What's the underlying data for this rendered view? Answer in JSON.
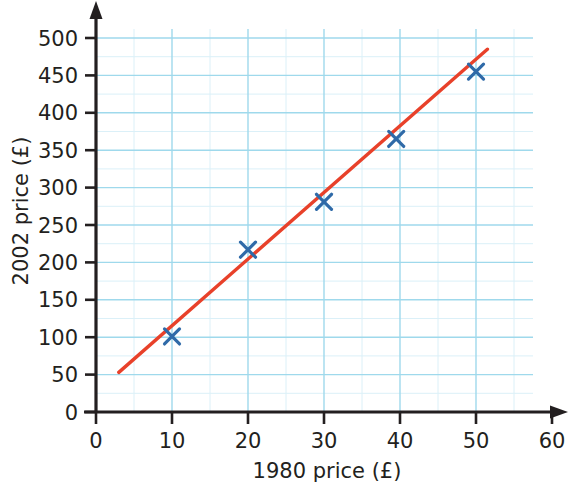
{
  "chart_data": {
    "type": "scatter",
    "title": "",
    "xlabel": "1980 price (£)",
    "ylabel": "2002 price (£)",
    "xlim": [
      0,
      63
    ],
    "ylim": [
      0,
      520
    ],
    "xticks": [
      0,
      10,
      20,
      30,
      40,
      50,
      60
    ],
    "yticks": [
      0,
      50,
      100,
      150,
      200,
      250,
      300,
      350,
      400,
      450,
      500
    ],
    "xtick_labels": [
      "0",
      "10",
      "20",
      "30",
      "40",
      "50",
      "60"
    ],
    "ytick_labels": [
      "0",
      "50",
      "100",
      "150",
      "200",
      "250",
      "300",
      "350",
      "400",
      "450",
      "500"
    ],
    "grid": true,
    "grid_major_x_step": 10,
    "grid_major_y_step": 50,
    "grid_minor_x_step": 5,
    "grid_minor_y_step": 25,
    "grid_x_extent": [
      0,
      57.5
    ],
    "grid_y_extent": [
      0,
      512
    ],
    "legend": "none",
    "series": [
      {
        "name": "Price data",
        "type": "scatter",
        "marker": "x",
        "color": "#2f6aa8",
        "points": [
          {
            "x": 10,
            "y": 101
          },
          {
            "x": 20,
            "y": 217
          },
          {
            "x": 30,
            "y": 281
          },
          {
            "x": 39.5,
            "y": 365
          },
          {
            "x": 50,
            "y": 455
          }
        ]
      },
      {
        "name": "Line of best fit",
        "type": "line",
        "color": "#e8412a",
        "x_start": 3,
        "y_start": 53,
        "x_end": 51.5,
        "y_end": 485
      }
    ],
    "colors": {
      "marker": "#2f6aa8",
      "fit_line": "#e8412a",
      "grid_major": "#9fd9ec",
      "grid_minor": "#dbf0f8",
      "axis": "#231f20",
      "text": "#231f20",
      "background": "#ffffff"
    }
  },
  "axes": {
    "x_axis_name": "x-axis",
    "y_axis_name": "y-axis",
    "x_title": "1980 price (£)",
    "y_title": "2002 price (£)"
  }
}
